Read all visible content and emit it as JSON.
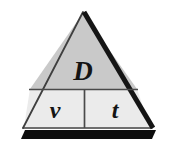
{
  "diagram": {
    "kind": "formula-triangle",
    "numerator": {
      "label": "D",
      "name": "distance"
    },
    "denominator_left": {
      "label": "v",
      "name": "speed"
    },
    "denominator_right": {
      "label": "t",
      "name": "time"
    },
    "colors": {
      "page_background": "#ffffff",
      "upper_fill": "#c9c9c9",
      "lower_fill": "#ebebeb",
      "outline_thin": "#4a4a4a",
      "outline_thick": "#151515",
      "shadow": "#0d0d0d",
      "glyph": "#141414"
    },
    "geometry": {
      "apex": [
        83,
        12
      ],
      "bottom_left": [
        23,
        128
      ],
      "bottom_right": [
        152,
        128
      ],
      "horizontal_divider_y": 89,
      "vertical_divider_x": 84,
      "shadow_band": {
        "x": 22,
        "y": 130,
        "width": 133,
        "height": 9
      }
    }
  }
}
